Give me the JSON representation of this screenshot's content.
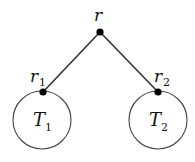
{
  "diagram": {
    "type": "binary-tree-schematic",
    "root": {
      "label": "r",
      "x": 100,
      "y": 32
    },
    "children": [
      {
        "label": "r",
        "sub": "1",
        "x": 43,
        "y": 92,
        "subtree": {
          "label": "T",
          "sub": "1",
          "cx": 42,
          "cy": 120,
          "r": 29
        }
      },
      {
        "label": "r",
        "sub": "2",
        "x": 158,
        "y": 92,
        "subtree": {
          "label": "T",
          "sub": "2",
          "cx": 158,
          "cy": 120,
          "r": 29
        }
      }
    ],
    "colors": {
      "stroke": "#333333",
      "node": "#000000"
    }
  }
}
